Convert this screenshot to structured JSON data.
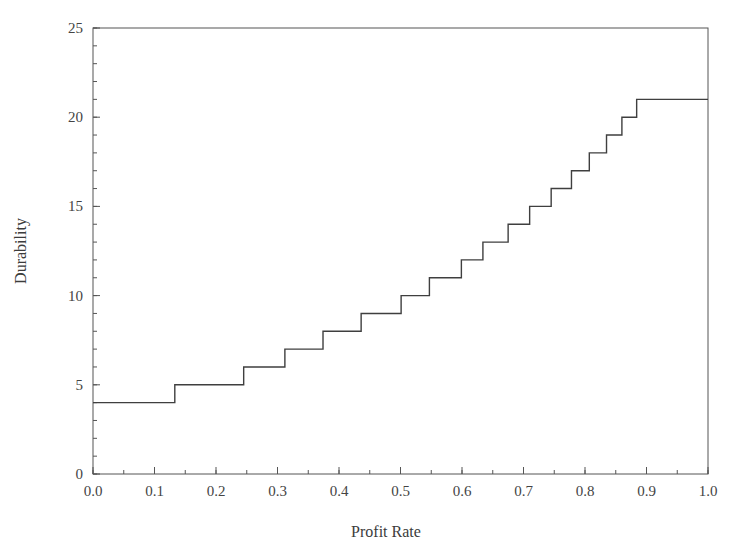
{
  "chart_data": {
    "type": "line",
    "title": "",
    "subtitle": "",
    "xlabel": "Profit Rate",
    "ylabel": "Durability",
    "xlim": [
      0.0,
      1.0
    ],
    "ylim": [
      0,
      25
    ],
    "grid": false,
    "legend": null,
    "line_style": "step-post",
    "line_color": "#3f3f3f",
    "line_width": 1.4,
    "xticks": [
      0.0,
      0.1,
      0.2,
      0.3,
      0.4,
      0.5,
      0.6,
      0.7,
      0.8,
      0.9,
      1.0
    ],
    "xtick_labels": [
      "0.0",
      "0.1",
      "0.2",
      "0.3",
      "0.4",
      "0.5",
      "0.6",
      "0.7",
      "0.8",
      "0.9",
      "1.0"
    ],
    "x_minor_step": 0.05,
    "yticks": [
      0,
      5,
      10,
      15,
      20,
      25
    ],
    "ytick_labels": [
      "0",
      "5",
      "10",
      "15",
      "20",
      "25"
    ],
    "y_minor_step": 1,
    "series": [
      {
        "name": "Durability vs Profit Rate",
        "x": [
          0.0,
          0.133,
          0.133,
          0.245,
          0.245,
          0.312,
          0.312,
          0.374,
          0.374,
          0.436,
          0.436,
          0.501,
          0.501,
          0.547,
          0.547,
          0.599,
          0.599,
          0.634,
          0.634,
          0.675,
          0.675,
          0.71,
          0.71,
          0.745,
          0.745,
          0.778,
          0.778,
          0.807,
          0.807,
          0.835,
          0.835,
          0.86,
          0.86,
          0.884,
          0.884,
          0.906,
          0.906,
          0.926,
          0.926,
          0.944,
          0.944,
          0.961,
          0.961,
          0.977,
          0.977,
          0.992,
          0.992,
          1.0
        ],
        "y": [
          4,
          4,
          5,
          5,
          6,
          6,
          7,
          7,
          8,
          8,
          9,
          9,
          10,
          10,
          11,
          11,
          12,
          12,
          13,
          13,
          14,
          14,
          15,
          15,
          16,
          16,
          17,
          17,
          18,
          18,
          19,
          19,
          20,
          20,
          21,
          21,
          21,
          21,
          21,
          21,
          21,
          21,
          21,
          21,
          21,
          21,
          21,
          21
        ]
      }
    ],
    "step_points": [
      {
        "profit_rate": 0.0,
        "durability": 4
      },
      {
        "profit_rate": 0.133,
        "durability": 5
      },
      {
        "profit_rate": 0.245,
        "durability": 6
      },
      {
        "profit_rate": 0.312,
        "durability": 7
      },
      {
        "profit_rate": 0.374,
        "durability": 8
      },
      {
        "profit_rate": 0.436,
        "durability": 9
      },
      {
        "profit_rate": 0.501,
        "durability": 10
      },
      {
        "profit_rate": 0.547,
        "durability": 11
      },
      {
        "profit_rate": 0.599,
        "durability": 12
      },
      {
        "profit_rate": 0.634,
        "durability": 13
      },
      {
        "profit_rate": 0.675,
        "durability": 14
      },
      {
        "profit_rate": 0.71,
        "durability": 15
      },
      {
        "profit_rate": 0.745,
        "durability": 16
      },
      {
        "profit_rate": 0.778,
        "durability": 17
      },
      {
        "profit_rate": 0.807,
        "durability": 18
      },
      {
        "profit_rate": 0.835,
        "durability": 19
      },
      {
        "profit_rate": 0.86,
        "durability": 20
      },
      {
        "profit_rate": 0.884,
        "durability": 21
      },
      {
        "profit_rate": 1.0,
        "durability": 21
      }
    ]
  },
  "style": {
    "background": "#ffffff",
    "axis_color": "#555555",
    "text_color": "#3c3c3c"
  }
}
